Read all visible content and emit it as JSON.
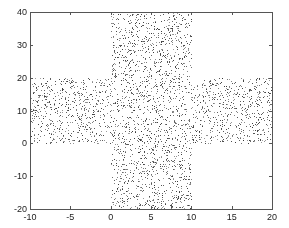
{
  "chart_data": {
    "type": "scatter",
    "title": "",
    "xlabel": "",
    "ylabel": "",
    "xlim": [
      -10,
      20
    ],
    "ylim": [
      -20,
      40
    ],
    "grid": false,
    "legend": null,
    "xticks": [
      -10,
      -5,
      0,
      5,
      10,
      15,
      20
    ],
    "yticks": [
      -20,
      -10,
      0,
      10,
      20,
      30,
      40
    ],
    "marker": {
      "color": "#333333",
      "size": 1
    },
    "regions": [
      {
        "name": "horizontal-band",
        "x": [
          -10,
          20
        ],
        "y": [
          0,
          20
        ]
      },
      {
        "name": "vertical-band",
        "x": [
          0,
          10
        ],
        "y": [
          -20,
          40
        ]
      }
    ],
    "approx_point_count": 3000,
    "seed": 12345
  },
  "layout": {
    "axes_px": {
      "left": 30,
      "top": 12,
      "right": 272,
      "bottom": 209
    },
    "axis_color": "#555555"
  }
}
